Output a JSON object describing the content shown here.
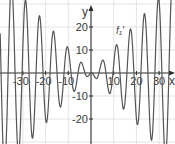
{
  "chart_data": {
    "type": "line",
    "title": "",
    "xlabel": "x",
    "ylabel": "y",
    "xlim": [
      -40,
      36
    ],
    "ylim": [
      -31,
      31
    ],
    "grid": true,
    "legend": null,
    "x_ticks": [
      -30,
      -20,
      -10,
      10,
      20,
      30
    ],
    "x_tick_labels": [
      "-30",
      "-20",
      "-10",
      "10",
      "20",
      "30"
    ],
    "y_ticks": [
      20,
      10,
      -10,
      -20
    ],
    "y_tick_labels": [
      "20",
      "10",
      "-10",
      "-20"
    ],
    "grid_x": [
      -30,
      -20,
      -10,
      10,
      20,
      30
    ],
    "grid_y": [
      30,
      20,
      10,
      -10,
      -20,
      -30
    ],
    "annotations": [
      {
        "text": "f₁'",
        "x": 11,
        "y": 17
      }
    ],
    "series": [
      {
        "name": "f₁'",
        "color": "#555555",
        "x": [
          -40,
          -39.5,
          -39,
          -38.5,
          -38,
          -37.5,
          -37,
          -36.5,
          -36,
          -35.5,
          -35,
          -34.5,
          -34,
          -33.5,
          -33,
          -32.5,
          -32,
          -31.5,
          -31,
          -30.5,
          -30,
          -29.5,
          -29,
          -28.5,
          -28,
          -27.5,
          -27,
          -26.5,
          -26,
          -25.5,
          -25,
          -24.5,
          -24,
          -23.5,
          -23,
          -22.5,
          -22,
          -21.5,
          -21,
          -20.5,
          -20,
          -19.5,
          -19,
          -18.5,
          -18,
          -17.5,
          -17,
          -16.5,
          -16,
          -15.5,
          -15,
          -14.5,
          -14,
          -13.5,
          -13,
          -12.5,
          -12,
          -11.5,
          -11,
          -10.5,
          -10,
          -9.5,
          -9,
          -8.5,
          -8,
          -7.5,
          -7,
          -6.5,
          -6,
          -5.5,
          -5,
          -4.5,
          -4,
          -3.5,
          -3,
          -2.5,
          -2,
          -1.5,
          -1,
          -0.5,
          0,
          0.5,
          1,
          1.5,
          2,
          2.5,
          3,
          3.5,
          4,
          4.5,
          5,
          5.5,
          6,
          6.5,
          7,
          7.5,
          8,
          8.5,
          9,
          9.5,
          10,
          10.5,
          11,
          11.5,
          12,
          12.5,
          13,
          13.5,
          14,
          14.5,
          15,
          15.5,
          16,
          16.5,
          17,
          17.5,
          18,
          18.5,
          19,
          19.5,
          20,
          20.5,
          21,
          21.5,
          22,
          22.5,
          23,
          23.5,
          24,
          24.5,
          25,
          25.5,
          26,
          26.5,
          27,
          27.5,
          28,
          28.5,
          29,
          29.5,
          30,
          30.5,
          31,
          31.5,
          32,
          32.5,
          33,
          33.5,
          34,
          34.5,
          35,
          35.5,
          36
        ],
        "values": [
          17.2,
          -4.7,
          -24.9,
          -38.3,
          -41.7,
          -34.5,
          -18.9,
          1.1,
          20.1,
          33.8,
          38.5,
          33.4,
          20.0,
          2.0,
          -16.0,
          -29.4,
          -35.1,
          -31.7,
          -20.5,
          -4.5,
          12.1,
          25.1,
          31.4,
          29.7,
          20.6,
          6.5,
          -8.6,
          -21.0,
          -27.7,
          -27.2,
          -19.9,
          -8.0,
          5.5,
          17.1,
          23.9,
          24.4,
          18.8,
          8.8,
          -3.0,
          -13.5,
          -20.1,
          -21.4,
          -17.3,
          -9.1,
          1.0,
          10.2,
          16.4,
          18.2,
          15.3,
          8.8,
          0.6,
          -7.3,
          -12.8,
          -14.8,
          -13.0,
          -8.1,
          -1.5,
          4.9,
          9.5,
          11.4,
          10.3,
          6.8,
          1.9,
          -2.9,
          -6.5,
          -8.0,
          -7.4,
          -5.1,
          -1.8,
          1.4,
          3.7,
          4.7,
          4.3,
          2.9,
          1.2,
          -0.4,
          -1.3,
          -1.5,
          -1.1,
          -0.4,
          0.0,
          0.0,
          -0.6,
          -1.5,
          -2.2,
          -2.4,
          -1.7,
          0.0,
          2.1,
          4.2,
          5.5,
          5.4,
          3.7,
          0.7,
          -3.1,
          -6.6,
          -8.7,
          -8.7,
          -6.3,
          -1.8,
          3.6,
          8.6,
          11.8,
          12.1,
          9.2,
          3.5,
          -3.6,
          -10.2,
          -14.7,
          -15.6,
          -12.4,
          -5.7,
          3.0,
          11.4,
          17.4,
          19.1,
          15.9,
          8.3,
          -1.8,
          -12.1,
          -19.7,
          -22.5,
          -19.6,
          -11.4,
          0.2,
          12.2,
          21.7,
          25.8,
          23.4,
          14.9,
          2.0,
          -11.8,
          -23.2,
          -28.9,
          -27.5,
          -18.7,
          -4.8,
          10.9,
          24.3,
          31.8,
          31.4,
          22.8,
          8.0,
          -9.3,
          -24.8,
          -34.4,
          -35.3,
          -27.2,
          -11.7,
          7.2,
          24.8,
          36.5,
          39.2
        ]
      }
    ]
  },
  "colors": {
    "grid": "#dcdcdc",
    "axis": "#2b2b2b",
    "curve": "#555555",
    "text": "#3a3a3a"
  },
  "layout": {
    "origin_px": [
      91,
      73
    ],
    "px_per_unit_x": 2.27,
    "px_per_unit_y": 2.3
  }
}
